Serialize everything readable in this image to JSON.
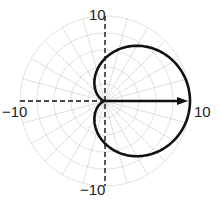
{
  "chart_data": {
    "type": "polar-line",
    "title": "",
    "equation": "r = 5(1 + cos θ)",
    "rlim": [
      0,
      10
    ],
    "r_gridlines": [
      2,
      4,
      6,
      8,
      10
    ],
    "theta_grid_step_deg": 15,
    "grid": true,
    "tick_labels": {
      "top": "10",
      "bottom": "−10",
      "left": "−10",
      "right": "10"
    },
    "series": [
      {
        "name": "cardioid",
        "theta_deg": [
          0,
          30,
          60,
          90,
          120,
          150,
          180,
          210,
          240,
          270,
          300,
          330,
          360
        ],
        "r": [
          10,
          9.33,
          7.5,
          5,
          2.5,
          0.67,
          0,
          0.67,
          2.5,
          5,
          7.5,
          9.33,
          10
        ],
        "color": "#111111"
      }
    ],
    "vector": {
      "from": [
        0,
        0
      ],
      "to": [
        10,
        0
      ],
      "color": "#111111"
    },
    "axes_style": "dashed",
    "legend": null
  },
  "colors": {
    "curve": "#111111",
    "grid": "#c4c4c4",
    "background": "#ffffff"
  }
}
